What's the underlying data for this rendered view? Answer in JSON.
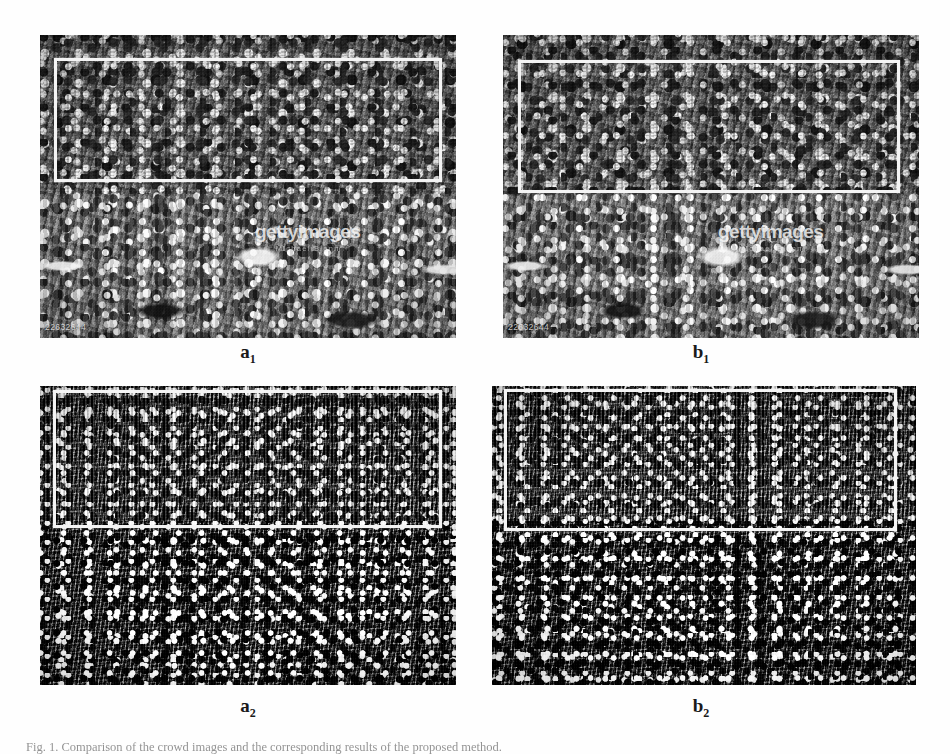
{
  "figure": {
    "domain": "paper-figure",
    "layout": "2x2 grid of grayscale crowd photographs with white ROI rectangles",
    "caption": "Fig. 1. Comparison of the crowd images and the corresponding results of the proposed method.",
    "panels": [
      {
        "id": "a1",
        "label_letter": "a",
        "label_sub": "1",
        "scene": "stadium-stands-crowd",
        "watermark": {
          "main": "gettyimages",
          "sub": "Michael Blann"
        },
        "image_id": "22632644",
        "roi": {
          "present": true,
          "color": "#f4f4f4"
        }
      },
      {
        "id": "b1",
        "label_letter": "b",
        "label_sub": "1",
        "scene": "stadium-stands-crowd",
        "watermark": {
          "main": "gettyimages",
          "sub": "Michael Blann"
        },
        "image_id": "22632644",
        "roi": {
          "present": true,
          "color": "#f4f4f4"
        }
      },
      {
        "id": "a2",
        "label_letter": "a",
        "label_sub": "2",
        "scene": "dense-overhead-crowd",
        "watermark": null,
        "image_id": null,
        "roi": {
          "present": true,
          "color": "#f4f4f4"
        }
      },
      {
        "id": "b2",
        "label_letter": "b",
        "label_sub": "2",
        "scene": "dense-overhead-crowd",
        "watermark": null,
        "image_id": null,
        "roi": {
          "present": true,
          "color": "#f4f4f4"
        }
      }
    ]
  },
  "colors": {
    "page_background": "#ffffff",
    "roi_rectangle": "#f4f4f4",
    "label_text": "#1a1a1a",
    "caption_text": "#3a3a3a"
  }
}
